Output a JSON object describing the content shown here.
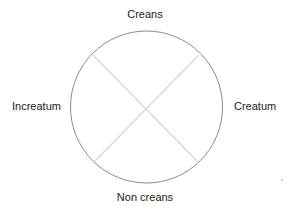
{
  "diagram": {
    "type": "semiotic-square-circle",
    "labels": {
      "top": "Creans",
      "bottom": "Non creans",
      "left": "Increatum",
      "right": "Creatum"
    },
    "colors": {
      "circle_stroke": "#8a8a8a",
      "diagonal_stroke": "#d6d6d6",
      "text": "#222222",
      "background": "#ffffff"
    }
  }
}
